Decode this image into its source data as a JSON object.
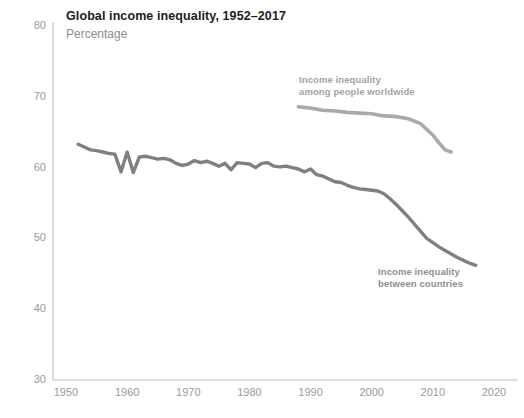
{
  "header": {
    "title": "Global income inequality, 1952–2017",
    "subtitle": "Percentage"
  },
  "colors": {
    "axis": "#bfbfbf",
    "tick_text": "#9a9a9a",
    "title_text": "#1c1c1c",
    "subtitle_text": "#8c8c8c",
    "series_worldwide": "#aaaaaa",
    "series_between": "#808080",
    "background": "#ffffff"
  },
  "annotations": {
    "worldwide_line1": "Income inequality",
    "worldwide_line2": "among people worldwide",
    "between_line1": "Income inequality",
    "between_line2": "between countries"
  },
  "chart_data": {
    "type": "line",
    "title": "Global income inequality, 1952–2017",
    "subtitle": "Percentage",
    "xlabel": "",
    "ylabel": "Percentage",
    "xlim": [
      1948,
      2022
    ],
    "ylim": [
      30,
      80
    ],
    "yticks": [
      30,
      40,
      50,
      60,
      70,
      80
    ],
    "xticks": [
      1950,
      1960,
      1970,
      1980,
      1990,
      2000,
      2010,
      2020
    ],
    "grid": false,
    "legend": "inline-annotations",
    "series": [
      {
        "name": "Income inequality among people worldwide",
        "color": "#aaaaaa",
        "x": [
          1988,
          1990,
          1992,
          1994,
          1996,
          1998,
          2000,
          2002,
          2004,
          2006,
          2008,
          2010,
          2011,
          2012,
          2013
        ],
        "values": [
          68.6,
          68.4,
          68.1,
          68.0,
          67.8,
          67.7,
          67.6,
          67.3,
          67.2,
          66.9,
          66.2,
          64.6,
          63.5,
          62.5,
          62.2
        ]
      },
      {
        "name": "Income inequality between countries",
        "color": "#808080",
        "x": [
          1952,
          1953,
          1954,
          1955,
          1956,
          1957,
          1958,
          1959,
          1960,
          1961,
          1962,
          1963,
          1964,
          1965,
          1966,
          1967,
          1968,
          1969,
          1970,
          1971,
          1972,
          1973,
          1974,
          1975,
          1976,
          1977,
          1978,
          1979,
          1980,
          1981,
          1982,
          1983,
          1984,
          1985,
          1986,
          1987,
          1988,
          1989,
          1990,
          1991,
          1992,
          1993,
          1994,
          1995,
          1996,
          1997,
          1998,
          1999,
          2000,
          2001,
          2002,
          2003,
          2004,
          2005,
          2006,
          2007,
          2008,
          2009,
          2010,
          2011,
          2012,
          2013,
          2014,
          2015,
          2016,
          2017
        ],
        "values": [
          63.3,
          62.9,
          62.5,
          62.4,
          62.2,
          62.0,
          61.9,
          59.4,
          62.2,
          59.3,
          61.5,
          61.6,
          61.4,
          61.2,
          61.3,
          61.1,
          60.6,
          60.3,
          60.5,
          61.0,
          60.7,
          60.9,
          60.6,
          60.2,
          60.6,
          59.7,
          60.7,
          60.6,
          60.5,
          60.0,
          60.6,
          60.7,
          60.2,
          60.1,
          60.2,
          60.0,
          59.8,
          59.4,
          59.8,
          59.0,
          58.8,
          58.4,
          58.0,
          57.9,
          57.5,
          57.2,
          57.0,
          56.9,
          56.8,
          56.7,
          56.3,
          55.6,
          54.8,
          53.9,
          53.0,
          52.0,
          51.0,
          50.0,
          49.4,
          48.8,
          48.3,
          47.8,
          47.3,
          46.9,
          46.5,
          46.2
        ]
      }
    ]
  }
}
